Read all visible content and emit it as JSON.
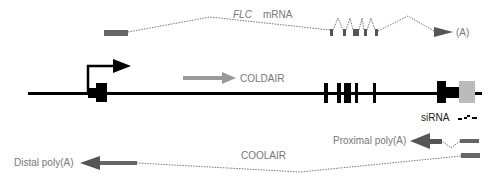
{
  "labels": {
    "flc_gene": "FLC",
    "mrna": "mRNA",
    "polyA_end": "(A)",
    "coldair": "COLDAIR",
    "sirna": "siRNA",
    "proximal": "Proximal poly(A)",
    "coolair": "COOLAIR",
    "distal": "Distal poly(A)"
  },
  "colors": {
    "gene_black": "#000000",
    "transcript_gray": "#666666",
    "coldair_gray": "#999999",
    "utr_light": "#bbbbbb",
    "label_gray": "#777777"
  }
}
